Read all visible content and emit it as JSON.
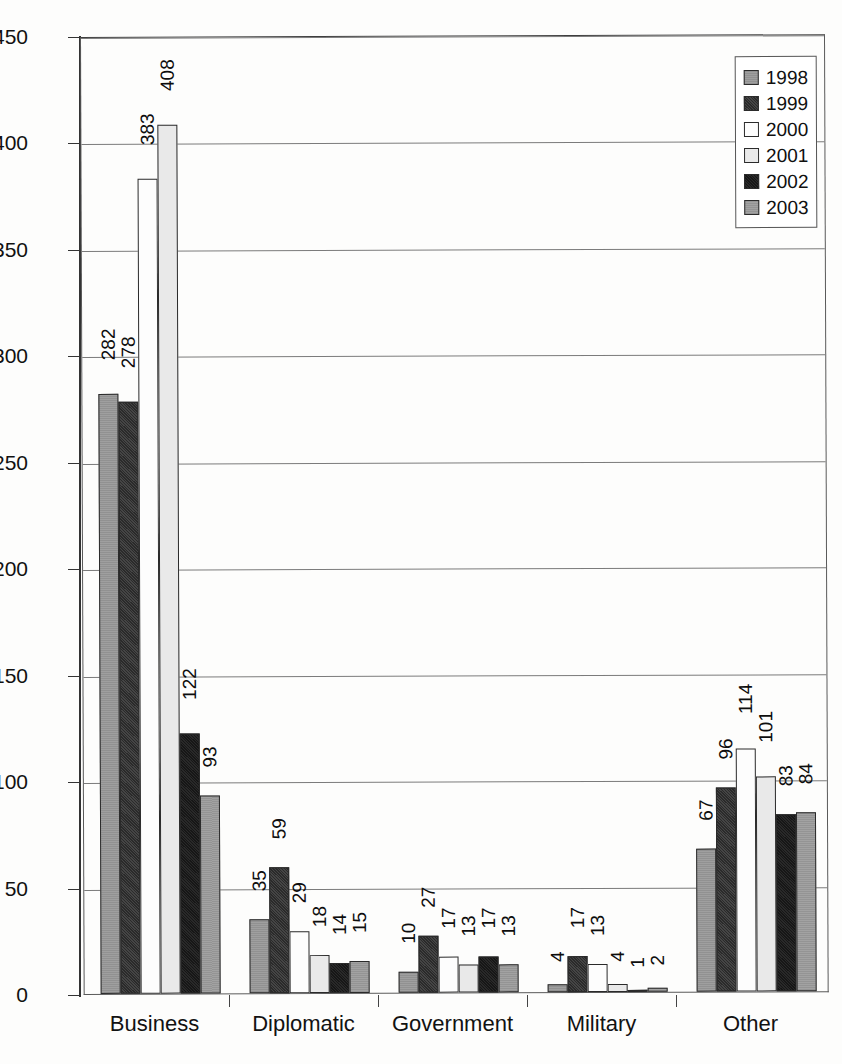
{
  "chart_data": {
    "type": "bar",
    "title": "",
    "subtitle": "",
    "xlabel": "",
    "ylabel": "",
    "ylim": [
      0,
      450
    ],
    "ytick_step": 50,
    "yticks": [
      "450",
      "400",
      "350",
      "300",
      "250",
      "200",
      "150",
      "100",
      "50",
      "0"
    ],
    "grid": true,
    "grid_axis": "y",
    "legend_position": "top-right",
    "orientation": "vertical",
    "grouping": "clustered",
    "value_labels": true,
    "value_label_rotation": -90,
    "categories": [
      "Business",
      "Diplomatic",
      "Government",
      "Military",
      "Other"
    ],
    "series": [
      {
        "name": "1998",
        "color": "#9a9a9a",
        "values": [
          282,
          35,
          10,
          4,
          67
        ]
      },
      {
        "name": "1999",
        "color": "#303030",
        "values": [
          278,
          59,
          27,
          17,
          96
        ]
      },
      {
        "name": "2000",
        "color": "#fdfdfd",
        "values": [
          383,
          29,
          17,
          13,
          114
        ]
      },
      {
        "name": "2001",
        "color": "#e9e9e9",
        "values": [
          408,
          18,
          13,
          4,
          101
        ]
      },
      {
        "name": "2002",
        "color": "#191919",
        "values": [
          122,
          14,
          17,
          1,
          83
        ]
      },
      {
        "name": "2003",
        "color": "#9d9d9d",
        "values": [
          93,
          15,
          13,
          2,
          84
        ]
      }
    ]
  },
  "legend": {
    "entries": [
      {
        "label": "1998"
      },
      {
        "label": "1999"
      },
      {
        "label": "2000"
      },
      {
        "label": "2001"
      },
      {
        "label": "2002"
      },
      {
        "label": "2003"
      }
    ]
  },
  "axes": {
    "y": {
      "min": 0,
      "max": 450,
      "step": 50
    },
    "x": {
      "categories": [
        "Business",
        "Diplomatic",
        "Government",
        "Military",
        "Other"
      ]
    }
  }
}
